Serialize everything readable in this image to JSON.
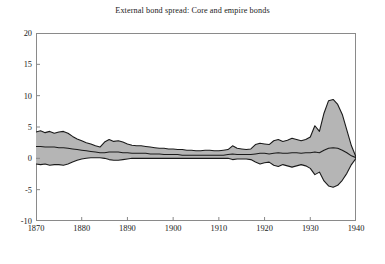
{
  "chart_data": {
    "type": "area",
    "title": "External bond spread: Core and empire bonds",
    "xlabel": "",
    "ylabel": "",
    "xlim": [
      1870,
      1940
    ],
    "ylim": [
      -10,
      20
    ],
    "grid": false,
    "legend": "none",
    "yticks": [
      20,
      15,
      10,
      5,
      0,
      -5,
      -10
    ],
    "xticks": [
      1870,
      1880,
      1890,
      1900,
      1910,
      1920,
      1930,
      1940
    ],
    "band_fill_color": "#b5b5b5",
    "line_color": "#1a1a1a",
    "axis_color": "#888888",
    "series": [
      {
        "name": "upper bound",
        "x": [
          1870,
          1871,
          1872,
          1873,
          1874,
          1875,
          1876,
          1877,
          1878,
          1879,
          1880,
          1881,
          1882,
          1883,
          1884,
          1885,
          1886,
          1887,
          1888,
          1889,
          1890,
          1891,
          1892,
          1893,
          1894,
          1895,
          1896,
          1897,
          1898,
          1899,
          1900,
          1901,
          1902,
          1903,
          1904,
          1905,
          1906,
          1907,
          1908,
          1909,
          1910,
          1911,
          1912,
          1913,
          1914,
          1915,
          1916,
          1917,
          1918,
          1919,
          1920,
          1921,
          1922,
          1923,
          1924,
          1925,
          1926,
          1927,
          1928,
          1929,
          1930,
          1931,
          1932,
          1933,
          1934,
          1935,
          1936,
          1937,
          1938,
          1939,
          1940
        ],
        "values": [
          4.2,
          4.4,
          4.1,
          4.3,
          4.0,
          4.2,
          4.3,
          4.0,
          3.5,
          3.1,
          2.8,
          2.5,
          2.3,
          2.0,
          1.8,
          2.6,
          3.0,
          2.7,
          2.8,
          2.6,
          2.3,
          2.1,
          2.0,
          2.0,
          1.9,
          1.8,
          1.7,
          1.6,
          1.6,
          1.5,
          1.5,
          1.4,
          1.4,
          1.3,
          1.3,
          1.2,
          1.2,
          1.3,
          1.3,
          1.2,
          1.2,
          1.3,
          1.4,
          2.0,
          1.6,
          1.5,
          1.4,
          1.5,
          2.2,
          2.4,
          2.3,
          2.2,
          2.8,
          3.0,
          2.7,
          2.9,
          3.2,
          3.0,
          2.8,
          3.0,
          3.4,
          5.2,
          4.3,
          7.2,
          9.2,
          9.4,
          8.6,
          7.0,
          4.5,
          2.0,
          0.2
        ]
      },
      {
        "name": "mean",
        "x": [
          1870,
          1871,
          1872,
          1873,
          1874,
          1875,
          1876,
          1877,
          1878,
          1879,
          1880,
          1881,
          1882,
          1883,
          1884,
          1885,
          1886,
          1887,
          1888,
          1889,
          1890,
          1891,
          1892,
          1893,
          1894,
          1895,
          1896,
          1897,
          1898,
          1899,
          1900,
          1901,
          1902,
          1903,
          1904,
          1905,
          1906,
          1907,
          1908,
          1909,
          1910,
          1911,
          1912,
          1913,
          1914,
          1915,
          1916,
          1917,
          1918,
          1919,
          1920,
          1921,
          1922,
          1923,
          1924,
          1925,
          1926,
          1927,
          1928,
          1929,
          1930,
          1931,
          1932,
          1933,
          1934,
          1935,
          1936,
          1937,
          1938,
          1939,
          1940
        ],
        "values": [
          1.9,
          1.9,
          1.8,
          1.8,
          1.8,
          1.7,
          1.7,
          1.6,
          1.5,
          1.4,
          1.3,
          1.2,
          1.1,
          1.0,
          0.9,
          0.9,
          1.0,
          1.0,
          1.0,
          0.9,
          0.9,
          0.8,
          0.8,
          0.8,
          0.8,
          0.7,
          0.7,
          0.7,
          0.6,
          0.6,
          0.6,
          0.6,
          0.5,
          0.5,
          0.5,
          0.5,
          0.5,
          0.5,
          0.5,
          0.5,
          0.5,
          0.5,
          0.6,
          0.7,
          0.6,
          0.6,
          0.6,
          0.6,
          0.7,
          0.8,
          0.8,
          0.7,
          0.8,
          0.9,
          0.8,
          0.8,
          0.9,
          0.9,
          0.8,
          0.9,
          0.9,
          1.0,
          0.9,
          1.3,
          1.6,
          1.7,
          1.6,
          1.3,
          0.9,
          0.4,
          0.1
        ]
      },
      {
        "name": "lower bound",
        "x": [
          1870,
          1871,
          1872,
          1873,
          1874,
          1875,
          1876,
          1877,
          1878,
          1879,
          1880,
          1881,
          1882,
          1883,
          1884,
          1885,
          1886,
          1887,
          1888,
          1889,
          1890,
          1891,
          1892,
          1893,
          1894,
          1895,
          1896,
          1897,
          1898,
          1899,
          1900,
          1901,
          1902,
          1903,
          1904,
          1905,
          1906,
          1907,
          1908,
          1909,
          1910,
          1911,
          1912,
          1913,
          1914,
          1915,
          1916,
          1917,
          1918,
          1919,
          1920,
          1921,
          1922,
          1923,
          1924,
          1925,
          1926,
          1927,
          1928,
          1929,
          1930,
          1931,
          1932,
          1933,
          1934,
          1935,
          1936,
          1937,
          1938,
          1939,
          1940
        ],
        "values": [
          -0.9,
          -1.0,
          -0.9,
          -1.1,
          -1.0,
          -1.0,
          -1.1,
          -0.9,
          -0.6,
          -0.3,
          -0.1,
          0.0,
          0.1,
          0.1,
          0.1,
          0.0,
          -0.2,
          -0.3,
          -0.3,
          -0.2,
          -0.1,
          0.0,
          0.0,
          0.0,
          0.0,
          0.0,
          0.0,
          0.0,
          0.0,
          0.0,
          0.0,
          0.0,
          0.0,
          0.0,
          0.0,
          0.0,
          0.0,
          0.0,
          0.0,
          0.0,
          0.0,
          0.0,
          0.0,
          -0.2,
          -0.1,
          -0.1,
          -0.1,
          -0.2,
          -0.6,
          -0.9,
          -0.7,
          -0.6,
          -1.1,
          -1.3,
          -1.0,
          -1.2,
          -1.4,
          -1.2,
          -1.0,
          -1.2,
          -1.6,
          -2.6,
          -2.2,
          -3.6,
          -4.4,
          -4.6,
          -4.3,
          -3.5,
          -2.4,
          -1.0,
          0.0
        ]
      }
    ]
  }
}
